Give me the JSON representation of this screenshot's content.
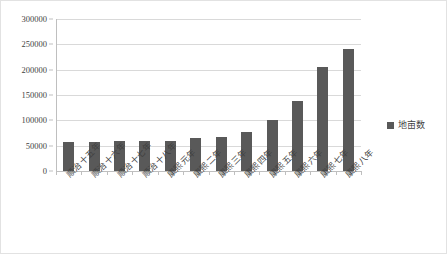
{
  "chart_data": {
    "type": "bar",
    "title": "",
    "subtitle": "",
    "xlabel": "",
    "ylabel": "",
    "categories": [
      "顺治十五年",
      "顺治十六年",
      "顺治十七年",
      "顺治十八年",
      "康熙元年",
      "康熙二年",
      "康熙三年",
      "康熙四年",
      "康熙五年",
      "康熙六年",
      "康熙七年",
      "康熙八年"
    ],
    "values": [
      57000,
      57000,
      59000,
      59000,
      60000,
      65000,
      67000,
      77000,
      100000,
      139000,
      205000,
      240000
    ],
    "series": [
      {
        "name": "地亩数",
        "values": [
          57000,
          57000,
          59000,
          59000,
          60000,
          65000,
          67000,
          77000,
          100000,
          139000,
          205000,
          240000
        ]
      }
    ],
    "ylim": [
      0,
      300000
    ],
    "ytick_values": [
      0,
      50000,
      100000,
      150000,
      200000,
      250000,
      300000
    ],
    "ytick_labels": [
      "0",
      "50000",
      "100000",
      "150000",
      "200000",
      "250000",
      "300000"
    ],
    "grid": true,
    "legend_position": "right",
    "bar_color": "#595959",
    "gridline_color": "#d9d9d9",
    "axis_color": "#bfbfbf",
    "border_color": "#e2e2e2",
    "text_color": "#3f3f3f"
  },
  "legend": {
    "entries": [
      {
        "label": "地亩数",
        "color": "#595959",
        "marker": "square-marker"
      }
    ]
  }
}
